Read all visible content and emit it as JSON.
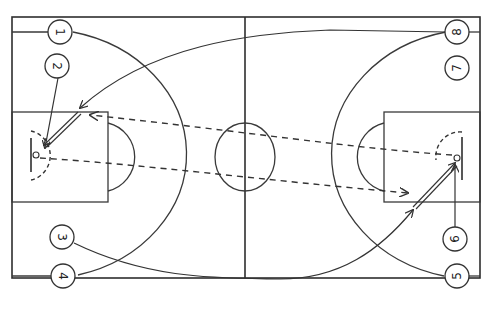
{
  "diagram": {
    "type": "basketball-court-play",
    "colors": {
      "line": "#3a3a3a",
      "background": "#ffffff"
    },
    "legend": {
      "solid-line": "player movement / cut",
      "dashed-line": "pass",
      "double-line": "screen / dribble"
    },
    "players": [
      {
        "id": "1",
        "label": "1",
        "x": 60,
        "y": 32,
        "rotate": 90
      },
      {
        "id": "2",
        "label": "2",
        "x": 57,
        "y": 66,
        "rotate": 90
      },
      {
        "id": "3",
        "label": "3",
        "x": 62,
        "y": 237,
        "rotate": 90
      },
      {
        "id": "4",
        "label": "4",
        "x": 63,
        "y": 276,
        "rotate": 90
      },
      {
        "id": "5",
        "label": "5",
        "x": 457,
        "y": 276,
        "rotate": -90
      },
      {
        "id": "6",
        "label": "6",
        "x": 455,
        "y": 239,
        "rotate": -90
      },
      {
        "id": "7",
        "label": "7",
        "x": 457,
        "y": 68,
        "rotate": -90
      },
      {
        "id": "8",
        "label": "8",
        "x": 457,
        "y": 32,
        "rotate": -90
      }
    ]
  }
}
